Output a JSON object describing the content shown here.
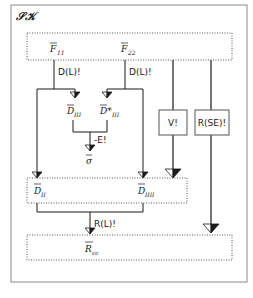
{
  "diagram": {
    "title": "𝒮𝒦",
    "colors": {
      "line": "#1a1a1a",
      "frame": "#8a8a8a",
      "dotted": "#555555",
      "background": "#ffffff"
    },
    "top_box": {
      "items": [
        {
          "symbol": "F",
          "sub": "11"
        },
        {
          "symbol": "F",
          "sub": "22"
        }
      ]
    },
    "operations": {
      "d_left": "D(L)!",
      "d_right": "D(L)!",
      "v": "V!",
      "rse": "R(SE)!",
      "e": "-E!",
      "rl": "R(L)!"
    },
    "middle_nodes": [
      {
        "symbol": "D",
        "sub": "III"
      },
      {
        "symbol": "D*",
        "sub": "III"
      },
      {
        "symbol": "σ",
        "sub": ""
      }
    ],
    "d_box": {
      "items": [
        {
          "symbol": "D",
          "sub": "II"
        },
        {
          "symbol": "D",
          "sub": "IIII"
        }
      ]
    },
    "r_box": {
      "items": [
        {
          "symbol": "R",
          "sub": "cc"
        }
      ]
    }
  }
}
